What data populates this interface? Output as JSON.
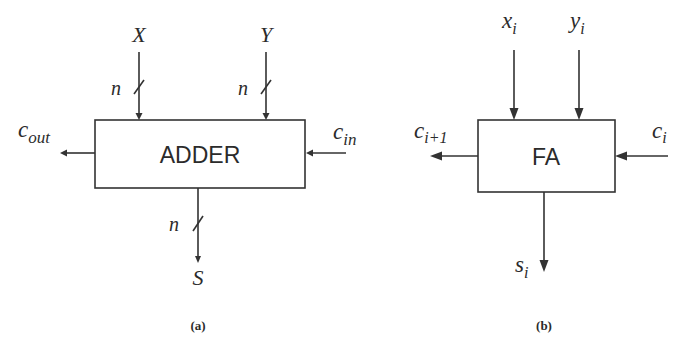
{
  "diagrams": [
    {
      "id": "a",
      "caption": "(a)",
      "block_label": "ADDER",
      "inputs": [
        {
          "name": "X",
          "width_label": "n",
          "bus": true
        },
        {
          "name": "Y",
          "width_label": "n",
          "bus": true
        }
      ],
      "carry_in": {
        "base": "c",
        "sub": "in"
      },
      "carry_out": {
        "base": "c",
        "sub": "out"
      },
      "output": {
        "name": "S",
        "width_label": "n",
        "bus": true
      }
    },
    {
      "id": "b",
      "caption": "(b)",
      "block_label": "FA",
      "inputs": [
        {
          "base": "x",
          "sub": "i"
        },
        {
          "base": "y",
          "sub": "i"
        }
      ],
      "carry_in": {
        "base": "c",
        "sub": "i"
      },
      "carry_out": {
        "base": "c",
        "sub": "i+1"
      },
      "output": {
        "base": "s",
        "sub": "i"
      }
    }
  ],
  "colors": {
    "stroke": "#333333",
    "text": "#2b2b2b",
    "background": "#ffffff"
  }
}
